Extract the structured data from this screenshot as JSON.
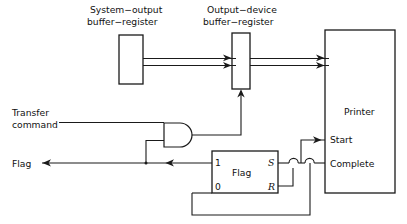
{
  "diagram": {
    "stroke_color": "#1a1a1a",
    "background_color": "#ffffff",
    "blocks": {
      "system_output_buffer": {
        "label_line1": "System−output",
        "label_line2": "buffer−register",
        "x": 119,
        "y": 35,
        "w": 24,
        "h": 49
      },
      "output_device_buffer": {
        "label_line1": "Output−device",
        "label_line2": "buffer−register",
        "x": 232,
        "y": 33,
        "w": 18,
        "h": 56
      },
      "printer": {
        "label": "Printer",
        "x": 325,
        "y": 30,
        "w": 70,
        "h": 163
      },
      "flag_flipflop": {
        "label": "Flag",
        "x": 212,
        "y": 151,
        "w": 66,
        "h": 42,
        "pin_out_top": "1",
        "pin_out_bottom": "0",
        "pin_in_top": "S",
        "pin_in_bottom": "R"
      },
      "and_gate": {
        "label": "and-gate",
        "x": 163,
        "y": 123,
        "w": 32,
        "h": 24
      }
    },
    "signals": {
      "transfer_command_line1": "Transfer",
      "transfer_command_line2": "command",
      "flag": "Flag",
      "start": "Start",
      "complete": "Complete"
    }
  }
}
